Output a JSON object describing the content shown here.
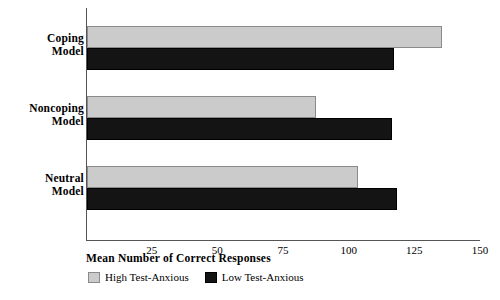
{
  "chart_data": {
    "type": "bar",
    "orientation": "horizontal",
    "title": "",
    "xlabel": "Mean Number of Correct Responses",
    "ylabel": "",
    "categories": [
      "Coping Model",
      "Noncoping Model",
      "Neutral Model"
    ],
    "series": [
      {
        "name": "High Test-Anxious",
        "color": "#cbcbcb",
        "values": [
          135,
          87,
          103
        ]
      },
      {
        "name": "Low Test-Anxious",
        "color": "#141414",
        "values": [
          117,
          116,
          118
        ]
      }
    ],
    "xlim": [
      0,
      150
    ],
    "xticks": [
      25,
      50,
      75,
      100,
      125,
      150
    ],
    "xtick_labels": [
      "25",
      "50",
      "75",
      "100",
      "125",
      "150"
    ],
    "grid": false,
    "legend_position": "bottom"
  },
  "categories": [
    {
      "line1": "Coping",
      "line2": "Model"
    },
    {
      "line1": "Noncoping",
      "line2": "Model"
    },
    {
      "line1": "Neutral",
      "line2": "Model"
    }
  ],
  "legend": [
    {
      "label": "High Test-Anxious",
      "swatch": "high-anxious-swatch"
    },
    {
      "label": "Low Test-Anxious",
      "swatch": "low-anxious-swatch"
    }
  ]
}
